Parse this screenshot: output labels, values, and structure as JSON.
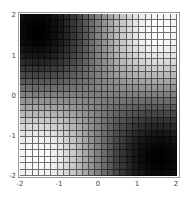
{
  "chart_data": {
    "type": "heatmap",
    "title": "",
    "xlabel": "",
    "ylabel": "",
    "xlim": [
      -2,
      2
    ],
    "ylim": [
      -2,
      2
    ],
    "grid": true,
    "plot_points": 25,
    "colormap": "grayscale (black = low, white = high)",
    "function_estimate": "z = sin(x) * sin(y)",
    "zlim": [
      -1,
      1
    ],
    "x_ticks": [
      "-2",
      "-1",
      "0",
      "1",
      "2"
    ],
    "y_ticks": [
      "2",
      "1",
      "0",
      "-1",
      "-2"
    ],
    "x_centers": [
      -1.92,
      -1.76,
      -1.6,
      -1.44,
      -1.28,
      -1.12,
      -0.96,
      -0.8,
      -0.64,
      -0.48,
      -0.32,
      -0.16,
      0,
      0.16,
      0.32,
      0.48,
      0.64,
      0.8,
      0.96,
      1.12,
      1.28,
      1.44,
      1.6,
      1.76,
      1.92
    ],
    "y_centers": [
      1.92,
      1.76,
      1.6,
      1.44,
      1.28,
      1.12,
      0.96,
      0.8,
      0.64,
      0.48,
      0.32,
      0.16,
      0,
      -0.16,
      -0.32,
      -0.48,
      -0.64,
      -0.8,
      -0.96,
      -1.12,
      -1.28,
      -1.44,
      -1.6,
      -1.76,
      -1.92
    ],
    "x_factor": [
      -0.94,
      -0.98,
      -1.0,
      -0.99,
      -0.96,
      -0.9,
      -0.82,
      -0.72,
      -0.6,
      -0.46,
      -0.31,
      -0.16,
      0,
      0.16,
      0.31,
      0.46,
      0.6,
      0.72,
      0.82,
      0.9,
      0.96,
      0.99,
      1.0,
      0.98,
      0.94
    ],
    "y_factor": [
      0.94,
      0.98,
      1.0,
      0.99,
      0.96,
      0.9,
      0.82,
      0.72,
      0.6,
      0.46,
      0.31,
      0.16,
      0,
      -0.16,
      -0.31,
      -0.46,
      -0.6,
      -0.72,
      -0.82,
      -0.9,
      -0.96,
      -0.99,
      -1.0,
      -0.98,
      -0.94
    ]
  },
  "axes": {
    "x_ticks": [
      {
        "label": "-2",
        "pos": 20
      },
      {
        "label": "-1",
        "pos": 59
      },
      {
        "label": "0",
        "pos": 98
      },
      {
        "label": "1",
        "pos": 137
      },
      {
        "label": "2",
        "pos": 176
      }
    ],
    "y_ticks": [
      {
        "label": "2",
        "pos": 15
      },
      {
        "label": "1",
        "pos": 56
      },
      {
        "label": "0",
        "pos": 96
      },
      {
        "label": "-1",
        "pos": 136
      },
      {
        "label": "-2",
        "pos": 176
      }
    ]
  }
}
